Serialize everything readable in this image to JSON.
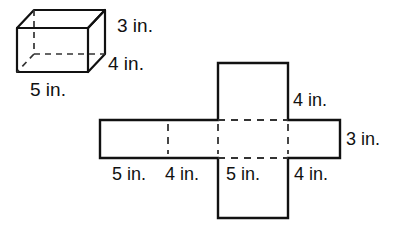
{
  "figure": {
    "stroke_color": "#111111",
    "dashed_color": "#333333",
    "background": "#ffffff"
  },
  "prism": {
    "name": "rectangular-prism",
    "labels": {
      "height": "3 in.",
      "depth": "4 in.",
      "width": "5 in."
    }
  },
  "net": {
    "name": "cross-net",
    "labels": {
      "top_right_flap": "4 in.",
      "right_height": "3 in.",
      "bottom_1": "5 in.",
      "bottom_2": "4 in.",
      "bottom_3": "5 in.",
      "bottom_4": "4 in."
    }
  }
}
